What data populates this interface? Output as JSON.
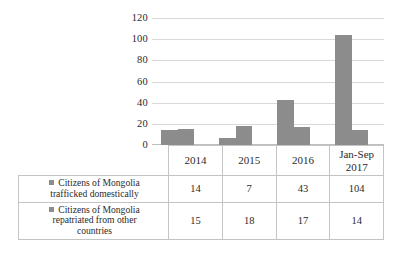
{
  "chart_data": {
    "type": "bar",
    "title": "",
    "subtitle": "",
    "xlabel": "",
    "ylabel": "",
    "ylim": [
      0,
      120
    ],
    "yticks": [
      0,
      20,
      40,
      60,
      80,
      100,
      120
    ],
    "ytick_labels": [
      "0",
      "20",
      "40",
      "60",
      "80",
      "100",
      "120"
    ],
    "grid": true,
    "legend_position": "table-rows-left",
    "categories": [
      "2014",
      "2015",
      "2016",
      "Jan-Sep 2017"
    ],
    "category_lines": [
      [
        "2014"
      ],
      [
        "2015"
      ],
      [
        "2016"
      ],
      [
        "Jan-Sep",
        "2017"
      ]
    ],
    "series": [
      {
        "name": "Citizens of Mongolia trafficked domestically",
        "name_lines": [
          "Citizens of Mongolia",
          "trafficked domestically"
        ],
        "color": "#8c8c8c",
        "values": [
          14,
          7,
          43,
          104
        ],
        "value_labels": [
          "14",
          "7",
          "43",
          "104"
        ]
      },
      {
        "name": "Citizens of Mongolia repatriated from other countries",
        "name_lines": [
          "Citizens of Mongolia",
          "repatriated from other",
          "countries"
        ],
        "color": "#8c8c8c",
        "values": [
          15,
          18,
          17,
          14
        ],
        "value_labels": [
          "15",
          "18",
          "17",
          "14"
        ]
      }
    ],
    "colors": {
      "bar": "#8c8c8c",
      "gridline": "#d9d9d9",
      "table_border": "#c4c4c4",
      "text": "#2b2b2b",
      "background": "#ffffff"
    }
  },
  "axis": {
    "tick_120": "120",
    "tick_100": "100",
    "tick_80": "80",
    "tick_60": "60",
    "tick_40": "40",
    "tick_20": "20",
    "tick_0": "0"
  },
  "table": {
    "years": {
      "y2014": "2014",
      "y2015": "2015",
      "y2016": "2016",
      "y2017_line1": "Jan-Sep",
      "y2017_line2": "2017"
    },
    "row1": {
      "label_line1": "Citizens of Mongolia",
      "label_line2": "trafficked domestically",
      "v2014": "14",
      "v2015": "7",
      "v2016": "43",
      "v2017": "104"
    },
    "row2": {
      "label_line1": "Citizens of Mongolia",
      "label_line2": "repatriated from other",
      "label_line3": "countries",
      "v2014": "15",
      "v2015": "18",
      "v2016": "17",
      "v2017": "14"
    }
  }
}
